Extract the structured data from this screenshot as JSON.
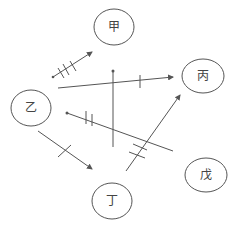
{
  "diagram": {
    "stroke_color": "#555555",
    "nodes": [
      {
        "id": "jia",
        "label": "甲",
        "cx": 114,
        "cy": 27,
        "rx": 20,
        "ry": 18
      },
      {
        "id": "bing",
        "label": "丙",
        "cx": 203,
        "cy": 76,
        "rx": 21,
        "ry": 17
      },
      {
        "id": "yi",
        "label": "乙",
        "cx": 31,
        "cy": 108,
        "rx": 20,
        "ry": 18
      },
      {
        "id": "wu",
        "label": "戊",
        "cx": 206,
        "cy": 175,
        "rx": 21,
        "ry": 17
      },
      {
        "id": "ding",
        "label": "丁",
        "cx": 112,
        "cy": 201,
        "rx": 20,
        "ry": 18
      }
    ],
    "edges": [
      {
        "id": "e1",
        "x1": 53,
        "y1": 77,
        "x2": 92,
        "y2": 52,
        "ticks": 3,
        "arrow_end": true
      },
      {
        "id": "e2",
        "x1": 58,
        "y1": 88,
        "x2": 173,
        "y2": 77,
        "ticks": 1,
        "arrow_end": true
      },
      {
        "id": "e3",
        "x1": 113,
        "y1": 71,
        "x2": 113,
        "y2": 147,
        "ticks": 0,
        "arrow_end": false
      },
      {
        "id": "e4",
        "x1": 67,
        "y1": 113,
        "x2": 173,
        "y2": 151,
        "ticks": 2,
        "arrow_end": false
      },
      {
        "id": "e5",
        "x1": 38,
        "y1": 131,
        "x2": 92,
        "y2": 169,
        "ticks": 1,
        "arrow_end": true
      },
      {
        "id": "e6",
        "x1": 126,
        "y1": 171,
        "x2": 180,
        "y2": 95,
        "ticks": 2,
        "arrow_end": true
      }
    ]
  }
}
